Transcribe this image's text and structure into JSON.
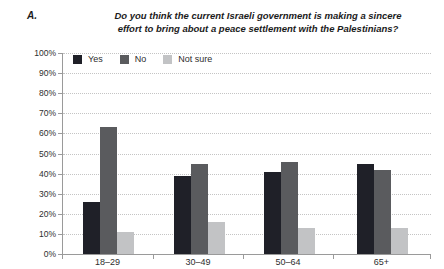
{
  "header": {
    "panel_label": "A.",
    "title_line1": "Do you think the current Israeli government is making a sincere",
    "title_line2": "effort to bring about a peace settlement with the Palestinians?"
  },
  "colors": {
    "yes": "#1f2028",
    "no": "#5a5b5e",
    "not_sure": "#c2c3c5",
    "gridline": "#c4c4c4",
    "axis": "#9a9a9a",
    "text": "#2e2e2e"
  },
  "chart_data": {
    "type": "bar",
    "title": "Do you think the current Israeli government is making a sincere effort to bring about a peace settlement with the Palestinians?",
    "categories": [
      "18–29",
      "30–49",
      "50–64",
      "65+"
    ],
    "series": [
      {
        "name": "Yes",
        "color": "#1f2028",
        "values": [
          26,
          39,
          41,
          45
        ]
      },
      {
        "name": "No",
        "color": "#5a5b5e",
        "values": [
          63,
          45,
          46,
          42
        ]
      },
      {
        "name": "Not sure",
        "color": "#c2c3c5",
        "values": [
          11,
          16,
          13,
          13
        ]
      }
    ],
    "xlabel": "",
    "ylabel": "",
    "ylim": [
      0,
      100
    ],
    "y_tick_step": 10,
    "y_tick_suffix": "%",
    "grid": "horizontal-dotted",
    "legend_position": "top-left-inside"
  }
}
